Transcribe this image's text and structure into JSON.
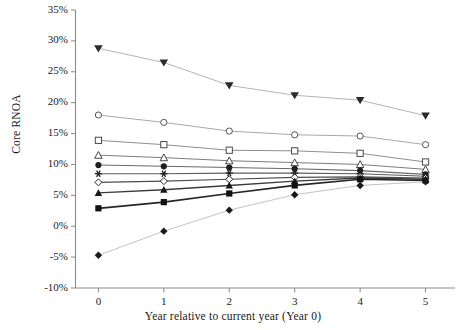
{
  "chart_data": {
    "type": "line",
    "title": "",
    "xlabel": "Year relative to current year (Year 0)",
    "ylabel": "Core RNOA",
    "x": [
      0,
      1,
      2,
      3,
      4,
      5
    ],
    "xtick_labels": [
      "0",
      "1",
      "2",
      "3",
      "4",
      "5"
    ],
    "ytick_labels": [
      "35%",
      "30%",
      "25%",
      "20%",
      "15%",
      "10%",
      "5%",
      "0%",
      "-5%",
      "-10%"
    ],
    "ytick_values": [
      35,
      30,
      25,
      20,
      15,
      10,
      5,
      0,
      -5,
      -10
    ],
    "xlim": [
      -0.35,
      5.45
    ],
    "ylim": [
      -10,
      35
    ],
    "grid": false,
    "legend": "none",
    "series": [
      {
        "name": "Portfolio 1",
        "marker": "filled-triangle-down",
        "color": "#b4b4b4",
        "marker_color": "#2b2b2b",
        "line_width": 1.0,
        "values": [
          28.8,
          26.5,
          22.8,
          21.2,
          20.4,
          17.9
        ]
      },
      {
        "name": "Portfolio 2",
        "marker": "open-circle",
        "color": "#a8a8a8",
        "marker_color": "#555555",
        "line_width": 1.0,
        "values": [
          18.0,
          16.8,
          15.4,
          14.8,
          14.6,
          13.2
        ]
      },
      {
        "name": "Portfolio 3",
        "marker": "open-square",
        "color": "#8f8f8f",
        "marker_color": "#4a4a4a",
        "line_width": 1.0,
        "values": [
          13.9,
          13.2,
          12.3,
          12.2,
          11.8,
          10.4
        ]
      },
      {
        "name": "Portfolio 4",
        "marker": "open-triangle-up",
        "color": "#7d7d7d",
        "marker_color": "#444444",
        "line_width": 1.0,
        "values": [
          11.5,
          11.1,
          10.6,
          10.3,
          10.0,
          9.2
        ]
      },
      {
        "name": "Portfolio 5",
        "marker": "filled-circle",
        "color": "#6a6a6a",
        "marker_color": "#1f1f1f",
        "line_width": 1.1,
        "values": [
          9.9,
          9.7,
          9.5,
          9.3,
          9.0,
          8.4
        ]
      },
      {
        "name": "Portfolio 6",
        "marker": "asterisk",
        "color": "#5c5c5c",
        "marker_color": "#1f1f1f",
        "line_width": 1.1,
        "values": [
          8.5,
          8.5,
          8.6,
          8.6,
          8.5,
          8.1
        ]
      },
      {
        "name": "Portfolio 7",
        "marker": "open-diamond",
        "color": "#4e4e4e",
        "marker_color": "#2a2a2a",
        "line_width": 1.2,
        "values": [
          7.1,
          7.3,
          7.6,
          7.9,
          8.0,
          7.8
        ]
      },
      {
        "name": "Portfolio 8",
        "marker": "filled-triangle-up",
        "color": "#3c3c3c",
        "marker_color": "#171717",
        "line_width": 1.4,
        "values": [
          5.4,
          5.9,
          6.6,
          7.3,
          7.8,
          7.6
        ]
      },
      {
        "name": "Portfolio 9",
        "marker": "filled-square",
        "color": "#262626",
        "marker_color": "#111111",
        "line_width": 1.7,
        "values": [
          2.9,
          3.9,
          5.3,
          6.6,
          7.6,
          7.4
        ]
      },
      {
        "name": "Portfolio 10",
        "marker": "filled-diamond",
        "color": "#c4c4c4",
        "marker_color": "#1a1a1a",
        "line_width": 1.0,
        "values": [
          -4.7,
          -0.8,
          2.6,
          5.1,
          6.6,
          7.2
        ]
      }
    ]
  },
  "axis": {
    "axis_color": "#8a8a8a",
    "tick_color": "#8a8a8a"
  }
}
